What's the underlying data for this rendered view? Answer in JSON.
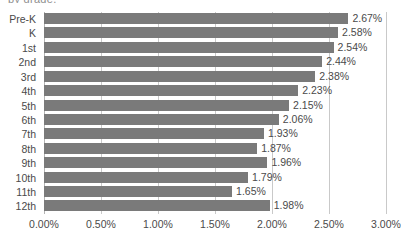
{
  "title_clipped": "by grade,",
  "chart_data": {
    "type": "bar",
    "orientation": "horizontal",
    "title": "by grade,",
    "xlabel": "",
    "ylabel": "",
    "categories": [
      "Pre-K",
      "K",
      "1st",
      "2nd",
      "3rd",
      "4th",
      "5th",
      "6th",
      "7th",
      "8th",
      "9th",
      "10th",
      "11th",
      "12th"
    ],
    "values": [
      2.67,
      2.58,
      2.54,
      2.44,
      2.38,
      2.23,
      2.15,
      2.06,
      1.93,
      1.87,
      1.96,
      1.79,
      1.65,
      1.98
    ],
    "data_labels": [
      "2.67%",
      "2.58%",
      "2.54%",
      "2.44%",
      "2.38%",
      "2.23%",
      "2.15%",
      "2.06%",
      "1.93%",
      "1.87%",
      "1.96%",
      "1.79%",
      "1.65%",
      "1.98%"
    ],
    "xlim": [
      0,
      3.0
    ],
    "xticks": [
      0,
      0.5,
      1.0,
      1.5,
      2.0,
      2.5,
      3.0
    ],
    "xtick_labels": [
      "0.00%",
      "0.50%",
      "1.00%",
      "1.50%",
      "2.00%",
      "2.50%",
      "3.00%"
    ],
    "grid": true,
    "grid_axis": "x",
    "legend": false,
    "bar_color": "#7a7a7a",
    "grid_color": "#c9c9c9",
    "text_color": "#4a4a4a",
    "background": "#ffffff"
  }
}
